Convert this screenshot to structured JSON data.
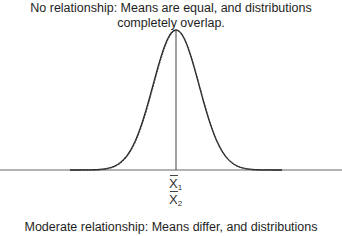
{
  "top_caption": {
    "line1": "No relationship: Means are equal, and distributions",
    "line2": "completely overlap."
  },
  "bottom_caption": {
    "line1": "Moderate relationship: Means differ, and distributions"
  },
  "mean_labels": [
    {
      "symbol": "X",
      "subscript": "1"
    },
    {
      "symbol": "X",
      "subscript": "2"
    }
  ],
  "colors": {
    "curve": "#222222",
    "baseline": "#666666",
    "mean_line": "#555555"
  },
  "diagram": {
    "type": "overlapping normal distributions",
    "distributions": 2,
    "means_equal": true
  }
}
